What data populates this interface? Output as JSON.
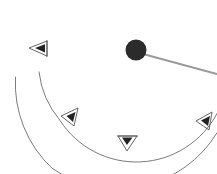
{
  "figure": {
    "background_color": "#ffffff",
    "width": 217,
    "height": 174
  },
  "palette": {
    "arc_stroke": "#6b6b6b",
    "marker_stroke": "#555555",
    "marker_fill": "#232323",
    "hub_fill": "#2b2b2b",
    "pointer_stroke": "#9a9a9a",
    "background": "#ffffff"
  },
  "hub": {
    "label": "hub",
    "center_x": 136,
    "center_y": 50,
    "radius": 10.5,
    "color": "#2b2b2b"
  },
  "pointer": {
    "label": "pointer",
    "x1": 145,
    "y1": 54,
    "x2": 217,
    "y2": 74,
    "color": "#9a9a9a",
    "width": 2
  },
  "arcs": [
    {
      "name": "inner-arc",
      "center_x": 129,
      "center_y": 53,
      "radius": 91,
      "start_angle_deg": 168,
      "end_angle_deg": 8,
      "sweep": "clockwise-through-bottom",
      "stroke": "#6b6b6b"
    },
    {
      "name": "outer-arc",
      "center_x": 129,
      "center_y": 53,
      "radius": 116,
      "start_angle_deg": 168,
      "end_angle_deg": 18,
      "sweep": "clockwise-through-bottom",
      "stroke": "#6b6b6b"
    }
  ],
  "markers": [
    {
      "name": "marker-upper-left",
      "apex_x": 29,
      "apex_y": 48,
      "size": 10,
      "rotation_deg": 180,
      "direction": "left",
      "on_arc": "inner-arc"
    },
    {
      "name": "marker-left-lower",
      "apex_x": 61,
      "apex_y": 116,
      "size": 10,
      "rotation_deg": 215,
      "direction": "down-left",
      "on_arc": "inner-arc"
    },
    {
      "name": "marker-bottom",
      "apex_x": 127,
      "apex_y": 150,
      "size": 10,
      "rotation_deg": 270,
      "direction": "down",
      "on_arc": "inner-arc"
    },
    {
      "name": "marker-right",
      "apex_x": 196,
      "apex_y": 121,
      "size": 10,
      "rotation_deg": 215,
      "direction": "down-left",
      "on_arc": "inner-arc"
    }
  ]
}
